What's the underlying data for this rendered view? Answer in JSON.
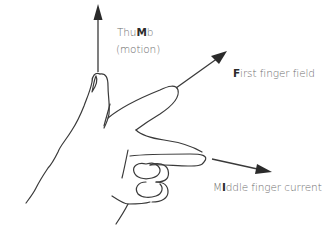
{
  "diagram": {
    "labels": {
      "thumb": {
        "prefix": "Thu",
        "bold": "M",
        "suffix": "b",
        "line2": "(motion)"
      },
      "first": {
        "prefix": "",
        "bold": "F",
        "suffix": "irst finger field"
      },
      "middle": {
        "prefix": "M",
        "bold": "I",
        "suffix": "ddle finger current"
      }
    },
    "arrows": [
      {
        "name": "thumb-arrow",
        "meaning": "motion",
        "direction": "up"
      },
      {
        "name": "first-finger-arrow",
        "meaning": "field",
        "direction": "up-right"
      },
      {
        "name": "middle-finger-arrow",
        "meaning": "current",
        "direction": "right"
      }
    ],
    "colors": {
      "line": "#3a3a3a",
      "text": "#6e6e6e",
      "emphasis": "#2b2b2b"
    }
  }
}
